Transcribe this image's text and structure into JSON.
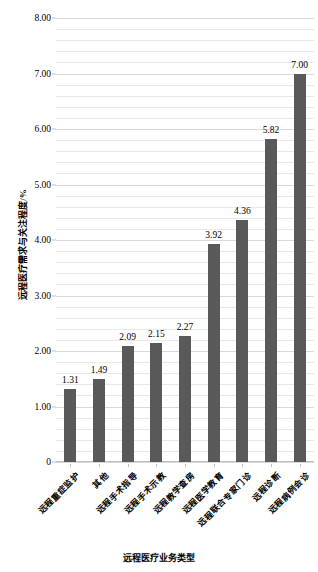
{
  "chart_data": {
    "type": "bar",
    "title": "",
    "xlabel": "远程医疗业务类型",
    "ylabel": "远程医疗需求与关注程度/%",
    "categories": [
      "远程重症监护",
      "其他",
      "远程手术指导",
      "远程手术示教",
      "远程教学查房",
      "远程医学教育",
      "远程联合专家门诊",
      "远程诊断",
      "远程病例会诊"
    ],
    "values": [
      1.31,
      1.49,
      2.09,
      2.15,
      2.27,
      3.92,
      4.36,
      5.82,
      7.0
    ],
    "value_labels": [
      "1.31",
      "1.49",
      "2.09",
      "2.15",
      "2.27",
      "3.92",
      "4.36",
      "5.82",
      "7.00"
    ],
    "ylim": [
      0,
      8
    ],
    "ytick_values": [
      0,
      1,
      2,
      3,
      4,
      5,
      6,
      7,
      8
    ],
    "ytick_labels": [
      "0",
      "1.00",
      "2.00",
      "3.00",
      "4.00",
      "5.00",
      "6.00",
      "7.00",
      "8.00"
    ],
    "minor_tick_step": 0.2,
    "grid": true,
    "grid_axis": "y",
    "legend": false,
    "bar_color": "#595959",
    "gridline_color": "#e8e8e8",
    "background_color": "#ffffff"
  }
}
